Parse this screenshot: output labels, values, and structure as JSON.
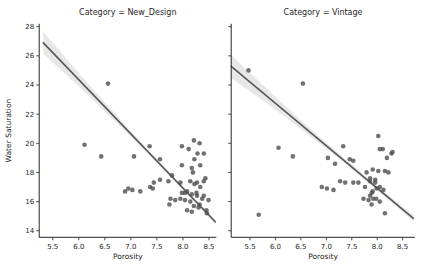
{
  "figure": {
    "width": 425,
    "height": 273,
    "background": "#ffffff"
  },
  "style": {
    "dot_color": "#4e4e4e",
    "dot_opacity": 0.8,
    "dot_radius": 2.3,
    "line_color": "#575757",
    "line_width": 1.6,
    "band_color": "#c9c9c9",
    "band_opacity": 0.45,
    "spine_color": "#262626",
    "tick_color": "#3a3a3a",
    "text_color": "#262626",
    "title_font_size": 8,
    "label_font_size": 7.5,
    "tick_font_size": 7
  },
  "chart_data": [
    {
      "type": "scatter",
      "title": "Category = New_Design",
      "xlabel": "Porosity",
      "ylabel": "Water Saturation",
      "legend": "none",
      "grid": false,
      "xlim": [
        5.24,
        8.64
      ],
      "ylim": [
        13.55,
        28.2
      ],
      "xticks": [
        5.5,
        6.0,
        6.5,
        7.0,
        7.5,
        8.0,
        8.5
      ],
      "yticks": [
        14,
        16,
        18,
        20,
        22,
        24,
        26,
        28
      ],
      "show_ytick_labels": true,
      "points": [
        [
          6.11,
          19.9
        ],
        [
          6.43,
          19.1
        ],
        [
          6.56,
          24.1
        ],
        [
          6.89,
          16.7
        ],
        [
          6.95,
          16.9
        ],
        [
          7.03,
          16.8
        ],
        [
          7.06,
          19.1
        ],
        [
          7.18,
          16.7
        ],
        [
          7.36,
          19.8
        ],
        [
          7.37,
          17.0
        ],
        [
          7.42,
          16.9
        ],
        [
          7.44,
          17.3
        ],
        [
          7.56,
          17.5
        ],
        [
          7.56,
          18.9
        ],
        [
          7.72,
          17.4
        ],
        [
          7.74,
          15.8
        ],
        [
          7.76,
          16.2
        ],
        [
          7.79,
          17.8
        ],
        [
          7.85,
          16.1
        ],
        [
          7.95,
          16.2
        ],
        [
          7.95,
          17.3
        ],
        [
          7.98,
          16.6
        ],
        [
          7.98,
          18.5
        ],
        [
          7.98,
          19.8
        ],
        [
          8.04,
          16.1
        ],
        [
          8.04,
          16.6
        ],
        [
          8.08,
          15.4
        ],
        [
          8.08,
          16.7
        ],
        [
          8.11,
          19.6
        ],
        [
          8.14,
          16.0
        ],
        [
          8.14,
          17.4
        ],
        [
          8.17,
          15.3
        ],
        [
          8.17,
          16.5
        ],
        [
          8.17,
          18.3
        ],
        [
          8.19,
          18.0
        ],
        [
          8.21,
          15.7
        ],
        [
          8.21,
          20.2
        ],
        [
          8.22,
          17.2
        ],
        [
          8.22,
          18.9
        ],
        [
          8.26,
          16.6
        ],
        [
          8.27,
          16.4
        ],
        [
          8.27,
          17.3
        ],
        [
          8.28,
          19.3
        ],
        [
          8.3,
          15.6
        ],
        [
          8.32,
          15.8
        ],
        [
          8.32,
          20.0
        ],
        [
          8.33,
          17.0
        ],
        [
          8.33,
          18.5
        ],
        [
          8.37,
          16.2
        ],
        [
          8.4,
          16.4
        ],
        [
          8.4,
          17.4
        ],
        [
          8.4,
          19.3
        ],
        [
          8.43,
          17.6
        ],
        [
          8.45,
          15.4
        ],
        [
          8.46,
          15.2
        ],
        [
          8.49,
          16.1
        ]
      ],
      "regression": {
        "slope": -3.72,
        "intercept": 46.68,
        "x_start": 5.32,
        "x_end": 8.62
      },
      "ci_band": {
        "x_mean": 7.9,
        "half_width_min": 0.12,
        "curvature": 0.095
      }
    },
    {
      "type": "scatter",
      "title": "Category = Vintage",
      "xlabel": "Porosity",
      "ylabel": "",
      "legend": "none",
      "grid": false,
      "xlim": [
        5.13,
        8.74
      ],
      "ylim": [
        13.55,
        28.2
      ],
      "xticks": [
        5.5,
        6.0,
        6.5,
        7.0,
        7.5,
        8.0,
        8.5
      ],
      "yticks": [
        14,
        16,
        18,
        20,
        22,
        24,
        26,
        28
      ],
      "show_ytick_labels": false,
      "points": [
        [
          5.47,
          25.0
        ],
        [
          5.67,
          15.1
        ],
        [
          6.06,
          19.7
        ],
        [
          6.34,
          19.1
        ],
        [
          6.54,
          24.1
        ],
        [
          6.91,
          17.0
        ],
        [
          7.01,
          16.9
        ],
        [
          7.03,
          19.0
        ],
        [
          7.14,
          16.8
        ],
        [
          7.17,
          18.6
        ],
        [
          7.27,
          17.4
        ],
        [
          7.33,
          19.8
        ],
        [
          7.37,
          17.3
        ],
        [
          7.46,
          18.9
        ],
        [
          7.53,
          17.3
        ],
        [
          7.53,
          18.8
        ],
        [
          7.63,
          17.3
        ],
        [
          7.73,
          16.2
        ],
        [
          7.76,
          17.0
        ],
        [
          7.79,
          18.0
        ],
        [
          7.83,
          16.1
        ],
        [
          7.86,
          16.4
        ],
        [
          7.86,
          17.4
        ],
        [
          7.86,
          17.6
        ],
        [
          7.89,
          15.8
        ],
        [
          7.89,
          16.6
        ],
        [
          7.91,
          16.7
        ],
        [
          7.91,
          18.2
        ],
        [
          7.92,
          16.2
        ],
        [
          7.96,
          17.3
        ],
        [
          7.96,
          17.5
        ],
        [
          7.98,
          16.2
        ],
        [
          7.99,
          16.9
        ],
        [
          8.02,
          18.1
        ],
        [
          8.02,
          20.5
        ],
        [
          8.05,
          16.0
        ],
        [
          8.05,
          17.0
        ],
        [
          8.05,
          19.6
        ],
        [
          8.11,
          19.6
        ],
        [
          8.12,
          16.8
        ],
        [
          8.15,
          15.2
        ],
        [
          8.15,
          18.1
        ],
        [
          8.19,
          19.0
        ],
        [
          8.22,
          18.0
        ],
        [
          8.28,
          19.3
        ],
        [
          8.3,
          19.4
        ]
      ],
      "regression": {
        "slope": -2.91,
        "intercept": 40.2,
        "x_start": 5.13,
        "x_end": 8.71
      },
      "ci_band": {
        "x_mean": 7.8,
        "half_width_min": 0.15,
        "curvature": 0.091
      }
    }
  ]
}
